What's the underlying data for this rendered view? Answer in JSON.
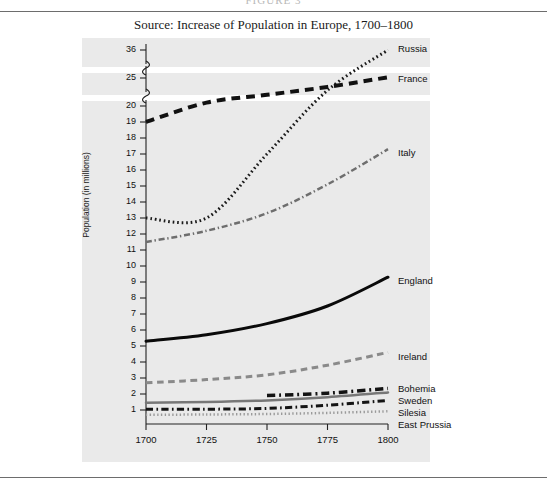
{
  "running_head": "FIGURE 3",
  "caption": "Source: Increase of Population in Europe, 1700–1800",
  "chart_data": {
    "type": "line",
    "title": "Increase of Population in Europe, 1700–1800",
    "xlabel": "",
    "ylabel": "Population (in millions)",
    "x": [
      1700,
      1725,
      1750,
      1775,
      1800
    ],
    "xlim": [
      1700,
      1800
    ],
    "xticks": [
      "1700",
      "1725",
      "1750",
      "1775",
      "1800"
    ],
    "yticks": [
      "1",
      "2",
      "3",
      "4",
      "5",
      "6",
      "7",
      "8",
      "9",
      "10",
      "11",
      "12",
      "13",
      "14",
      "15",
      "16",
      "17",
      "18",
      "19",
      "20",
      "25",
      "36"
    ],
    "ylim": [
      0,
      36
    ],
    "axis_break": true,
    "axis_break_note": "Scale is linear 1–20, then broken before 25 and again before 36",
    "grid": false,
    "legend_position": "right-inline",
    "series": [
      {
        "name": "Russia",
        "label": "Russia",
        "style": "dotted",
        "color": "#1a1a1a",
        "width": 3,
        "values": [
          13.0,
          13.0,
          17.0,
          22.8,
          36.0
        ]
      },
      {
        "name": "France",
        "label": "France",
        "style": "dashed",
        "color": "#111111",
        "width": 4,
        "values": [
          19.0,
          20.6,
          22.0,
          23.4,
          25.3
        ]
      },
      {
        "name": "Italy",
        "label": "Italy",
        "style": "dash-dot",
        "color": "#6e6e6e",
        "width": 2.5,
        "values": [
          11.5,
          12.2,
          13.3,
          15.1,
          17.3
        ]
      },
      {
        "name": "England",
        "label": "England",
        "style": "solid",
        "color": "#0a0a0a",
        "width": 3,
        "values": [
          5.3,
          5.7,
          6.4,
          7.5,
          9.3
        ]
      },
      {
        "name": "Ireland",
        "label": "Ireland",
        "style": "dashed",
        "color": "#8a8a8a",
        "width": 3,
        "values": [
          2.7,
          2.9,
          3.2,
          3.8,
          4.6
        ]
      },
      {
        "name": "Bohemia",
        "label": "Bohemia",
        "style": "dash-dot",
        "color": "#131313",
        "width": 3.5,
        "values": [
          null,
          null,
          1.9,
          2.05,
          2.35
        ]
      },
      {
        "name": "Sweden",
        "label": "Sweden",
        "style": "solid",
        "color": "#777777",
        "width": 2.5,
        "values": [
          1.45,
          1.5,
          1.6,
          1.8,
          2.1
        ]
      },
      {
        "name": "Silesia",
        "label": "Silesia",
        "style": "dash-dot",
        "color": "#141414",
        "width": 3,
        "values": [
          1.05,
          1.05,
          1.1,
          1.3,
          1.6
        ]
      },
      {
        "name": "East Prussia",
        "label": "East Prussia",
        "style": "dotted",
        "color": "#9a9a9a",
        "width": 2.5,
        "values": [
          0.7,
          0.72,
          0.75,
          0.82,
          0.92
        ]
      }
    ]
  },
  "colors": {
    "panel_background": "#eaeaea",
    "page_background": "#ffffff",
    "rule": "#6d6d6d",
    "text": "#111111"
  }
}
